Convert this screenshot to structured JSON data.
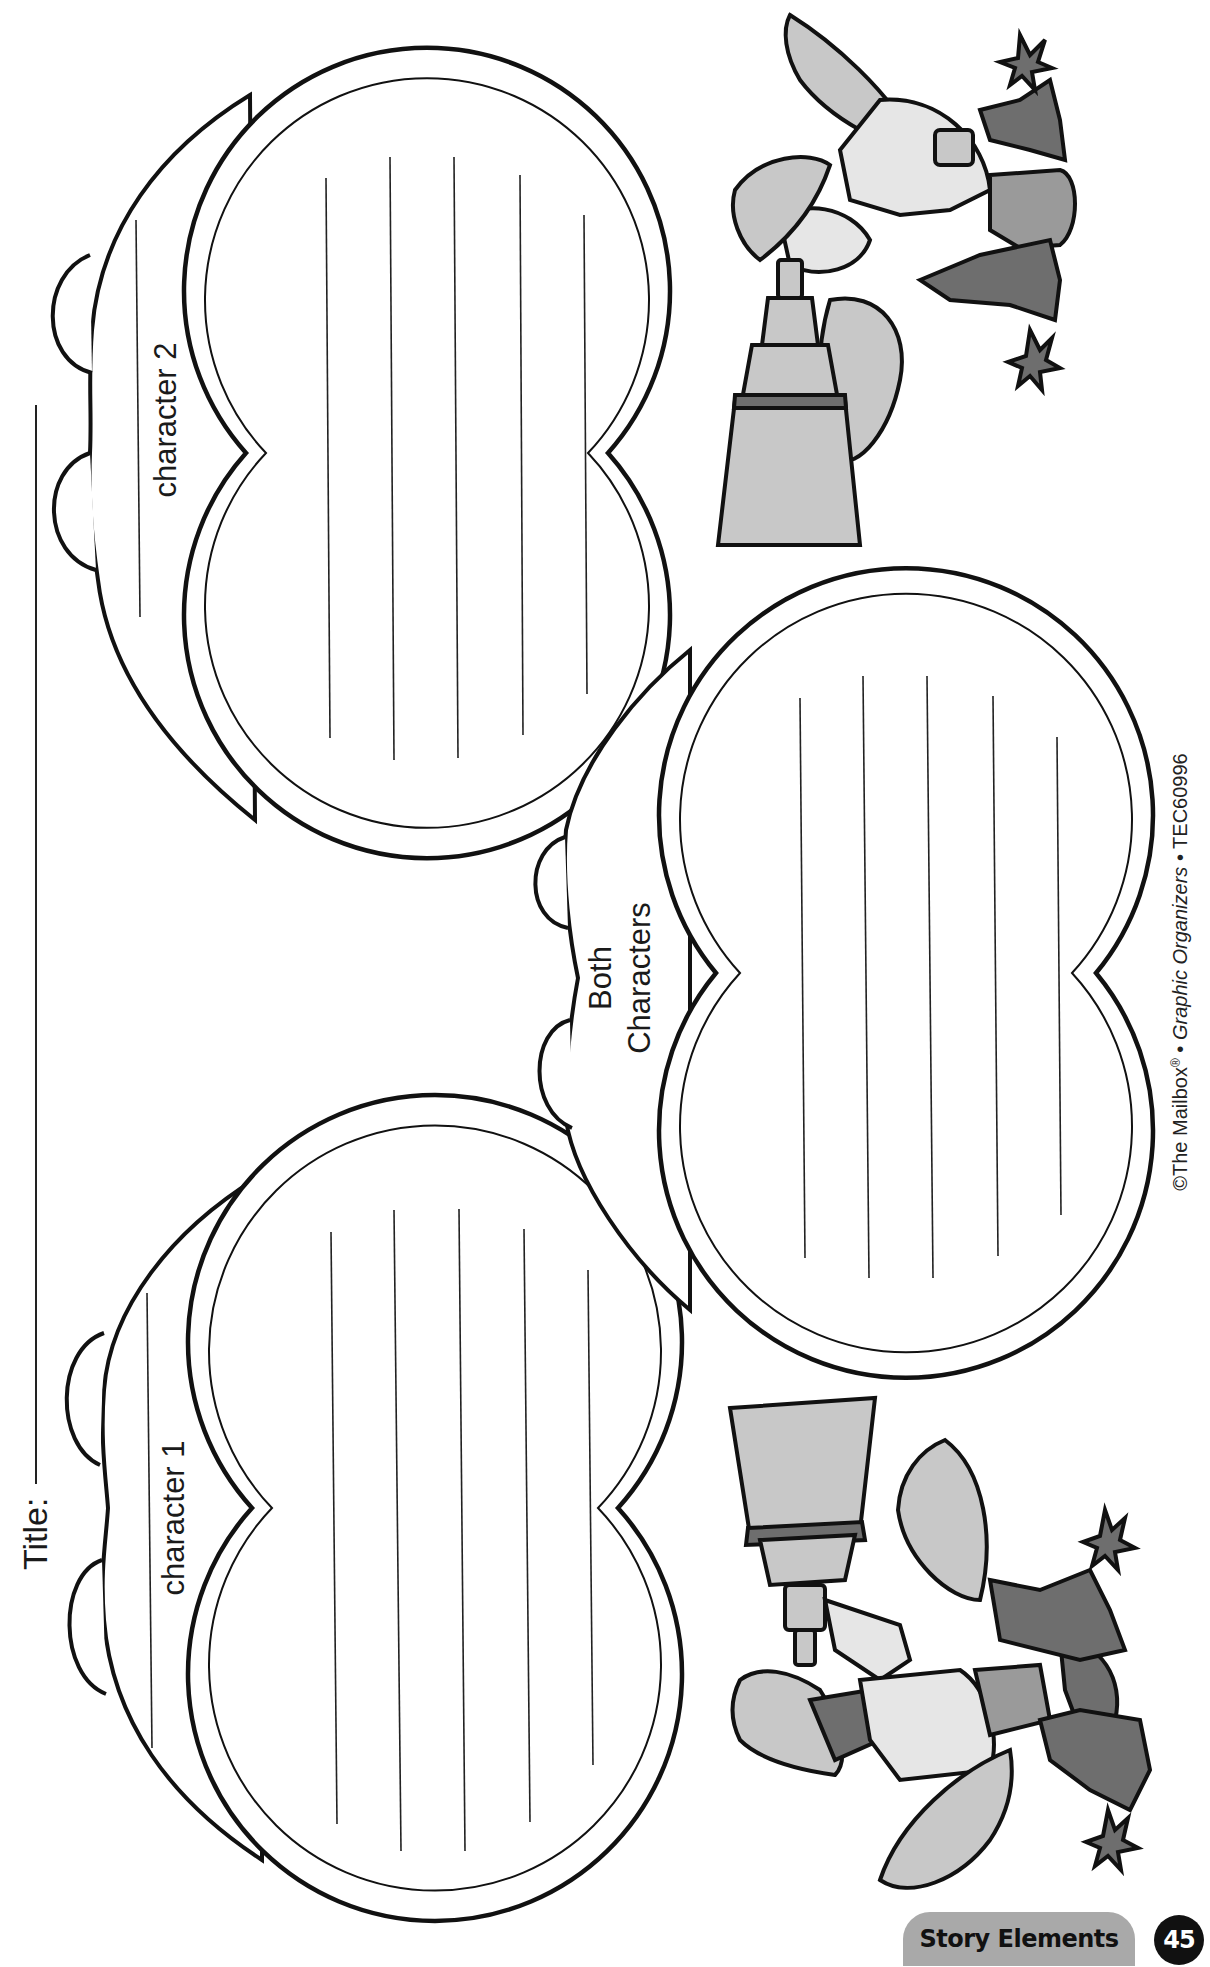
{
  "worksheet": {
    "title_label": "Title:",
    "organizer_type": "Venn-style character comparison",
    "sections": [
      {
        "id": "character-1",
        "label": "character 1",
        "writing_lines": 5
      },
      {
        "id": "both-characters",
        "label_line1": "Both",
        "label_line2": "Characters",
        "writing_lines": 5
      },
      {
        "id": "character-2",
        "label": "character 2",
        "writing_lines": 5
      }
    ],
    "illustrations": [
      {
        "name": "explorer-with-telescope-top",
        "description": "Safari explorer looking through telescope among jungle leaves"
      },
      {
        "name": "explorer-with-telescope-bottom",
        "description": "Safari explorer looking through telescope among jungle leaves"
      }
    ]
  },
  "copyright": {
    "prefix": "©The Mailbox",
    "reg": "®",
    "sep1": " • ",
    "book": "Graphic Organizers",
    "sep2": " • ",
    "code": "TEC60996"
  },
  "footer": {
    "section_label": "Story Elements",
    "page_number": "45"
  },
  "colors": {
    "ink": "#111111",
    "pill_gray": "#a9a9a9",
    "page_num_bg": "#111111",
    "background": "#ffffff"
  }
}
